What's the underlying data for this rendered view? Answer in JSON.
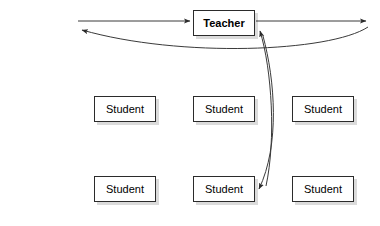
{
  "diagram": {
    "type": "classroom-interaction-diagram",
    "background_color": "#ffffff",
    "line_color": "#3a3a3a",
    "node_border_color": "#2b2b2b",
    "node_fill_color": "#ffffff",
    "shadow_color": "#d9d9d9",
    "nodes": [
      {
        "id": "teacher",
        "label": "Teacher",
        "bold": true,
        "x": 193,
        "y": 10,
        "width": 62,
        "height": 26
      },
      {
        "id": "student-mid-left",
        "label": "Student",
        "bold": false,
        "x": 94,
        "y": 96,
        "width": 62,
        "height": 26
      },
      {
        "id": "student-mid-center",
        "label": "Student",
        "bold": false,
        "x": 193,
        "y": 96,
        "width": 62,
        "height": 26
      },
      {
        "id": "student-mid-right",
        "label": "Student",
        "bold": false,
        "x": 292,
        "y": 96,
        "width": 62,
        "height": 26
      },
      {
        "id": "student-bottom-left",
        "label": "Student",
        "bold": false,
        "x": 94,
        "y": 176,
        "width": 62,
        "height": 26
      },
      {
        "id": "student-bottom-center",
        "label": "Student",
        "bold": false,
        "x": 193,
        "y": 176,
        "width": 62,
        "height": 26
      },
      {
        "id": "student-bottom-right",
        "label": "Student",
        "bold": false,
        "x": 292,
        "y": 176,
        "width": 62,
        "height": 26
      }
    ],
    "edges": [
      {
        "id": "edge-left-into-teacher",
        "kind": "straight",
        "from": "left-margin",
        "to": "teacher",
        "arrowhead": "end",
        "path": "M 78 21 L 190 21"
      },
      {
        "id": "edge-teacher-to-right",
        "kind": "straight",
        "from": "teacher",
        "to": "right-margin",
        "arrowhead": "end",
        "path": "M 256 21 L 366 21"
      },
      {
        "id": "edge-right-curve-to-left",
        "kind": "curved",
        "from": "right-margin",
        "to": "left-margin",
        "arrowhead": "end",
        "path": "M 368 27 C 330 52 180 58 82 30"
      },
      {
        "id": "edge-student-to-teacher",
        "kind": "curved",
        "from": "student-bottom-center",
        "to": "teacher",
        "arrowhead": "end",
        "path": "M 266 186 C 276 140 272 70 260 31"
      },
      {
        "id": "edge-teacher-to-student",
        "kind": "curved",
        "from": "teacher",
        "to": "student-bottom-center",
        "arrowhead": "end",
        "path": "M 263 36 C 275 80 280 145 259 189"
      }
    ]
  }
}
